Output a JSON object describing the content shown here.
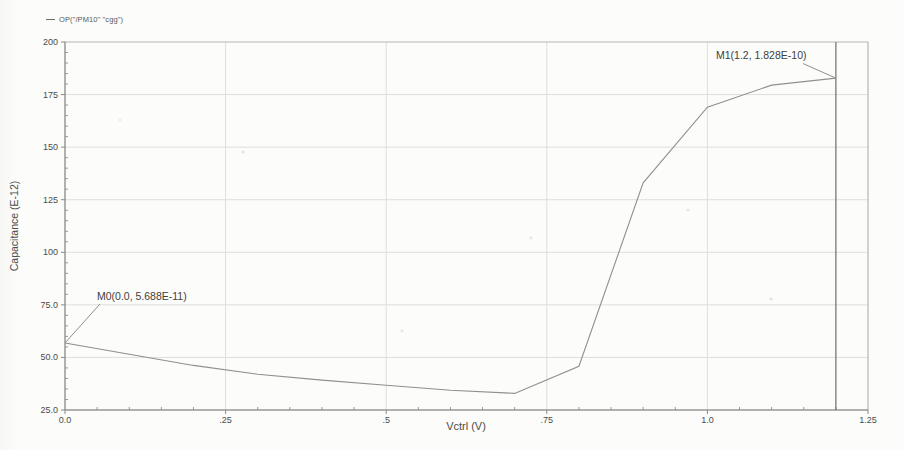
{
  "colors": {
    "background": "#fcfcfa",
    "grid": "#dededa",
    "border": "#b5b5b0",
    "axis": "#8a8a85",
    "curve": "#8f8f8b",
    "marker_line": "#6e6e6a",
    "text": "#4b4b48"
  },
  "chart_data": {
    "type": "line",
    "title": "",
    "xlabel": "Vctrl (V)",
    "ylabel": "Capacitance (E-12)",
    "xlim": [
      0,
      1.25
    ],
    "ylim": [
      25,
      200
    ],
    "grid": true,
    "legend_position": "top-left",
    "x_ticks": [
      {
        "v": 0,
        "t": "0.0"
      },
      {
        "v": 0.25,
        "t": ".25"
      },
      {
        "v": 0.5,
        "t": ".5"
      },
      {
        "v": 0.75,
        "t": ".75"
      },
      {
        "v": 1.0,
        "t": "1.0"
      },
      {
        "v": 1.25,
        "t": "1.25"
      }
    ],
    "y_ticks": [
      {
        "v": 200,
        "t": "200"
      },
      {
        "v": 175,
        "t": "175"
      },
      {
        "v": 150,
        "t": "150"
      },
      {
        "v": 125,
        "t": "125"
      },
      {
        "v": 100,
        "t": "100"
      },
      {
        "v": 75,
        "t": "75.0"
      },
      {
        "v": 50,
        "t": "50.0"
      },
      {
        "v": 25,
        "t": "25.0"
      }
    ],
    "x_minor_step": 0.05,
    "y_minor_step": 5,
    "series": [
      {
        "name": "OP(\"/PM10\" \"cgg\")",
        "x": [
          0.0,
          0.1,
          0.2,
          0.3,
          0.4,
          0.5,
          0.6,
          0.7,
          0.8,
          0.9,
          1.0,
          1.1,
          1.2
        ],
        "y": [
          56.88,
          51.5,
          46.2,
          42.0,
          39.2,
          36.8,
          34.4,
          32.9,
          45.8,
          133.0,
          169.0,
          179.5,
          182.8
        ],
        "color": "#8f8f8b"
      }
    ],
    "markers": [
      {
        "name": "M0",
        "label": "M0(0.0, 5.688E-11)",
        "x": 0.0,
        "y": 56.88,
        "vline": false
      },
      {
        "name": "M1",
        "label": "M1(1.2, 1.828E-10)",
        "x": 1.2,
        "y": 182.8,
        "vline": true
      }
    ]
  }
}
